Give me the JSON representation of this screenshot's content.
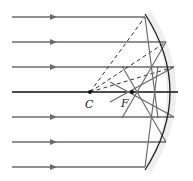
{
  "diagram": {
    "labels": {
      "center": "C",
      "focus": "F"
    },
    "colors": {
      "ray": "#6b6b6b",
      "axis": "#111111",
      "mirror": "#222222",
      "mirror_shade": "#e6e6e6",
      "dashed": "#333333"
    },
    "points": {
      "C": [
        90,
        92
      ],
      "F": [
        132,
        92
      ]
    },
    "incident_rays_y": [
      17,
      42,
      67,
      117,
      142,
      167
    ],
    "axis_y": 92
  }
}
